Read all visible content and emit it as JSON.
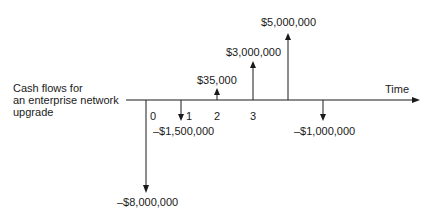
{
  "diagram": {
    "title_lines": [
      "Cash flows for",
      "an enterprise network",
      "upgrade"
    ],
    "axis_label": "Time",
    "periods": [
      "0",
      "1",
      "2",
      "3"
    ],
    "cash_flows": [
      {
        "period": 0,
        "label": "–$8,000,000",
        "value": -8000000
      },
      {
        "period": 1,
        "label": "–$1,500,000",
        "value": -1500000
      },
      {
        "period": 2,
        "label": "$35,000",
        "value": 35000
      },
      {
        "period": 3,
        "label": "$3,000,000",
        "value": 3000000
      },
      {
        "period": 4,
        "label": "$5,000,000",
        "value": 5000000
      },
      {
        "period": 5,
        "label": "–$1,000,000",
        "value": -1000000
      }
    ],
    "line_color": "#1a1a1a"
  }
}
